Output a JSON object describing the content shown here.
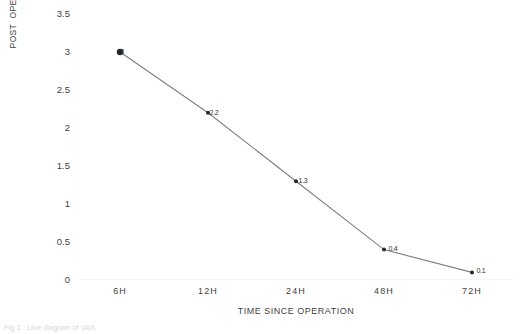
{
  "chart_data": {
    "type": "line",
    "title": "",
    "xlabel": "TIME SINCE OPERATION",
    "ylabel": "POST  OPERATIVE VAS PAIN SCALE",
    "categories": [
      "6H",
      "12H",
      "24H",
      "48H",
      "72H"
    ],
    "values": [
      3,
      2.2,
      1.3,
      0.4,
      0.1
    ],
    "point_labels": [
      "3",
      "2.2",
      "1.3",
      "0.4",
      "0.1"
    ],
    "yticks": [
      "0",
      "0.5",
      "1",
      "1.5",
      "2",
      "2.5",
      "3",
      "3.5"
    ],
    "ylim": [
      0,
      3.5
    ],
    "ystep": 0.5,
    "grid": false,
    "legend": "none",
    "series_name": "Post operative VAS pain scale",
    "line_color": "#7f7f7f",
    "marker_color": "#262626",
    "label_color": "#2e2e2e"
  },
  "caption": {
    "text": "Fig 1 : Line diagram of VAS"
  }
}
